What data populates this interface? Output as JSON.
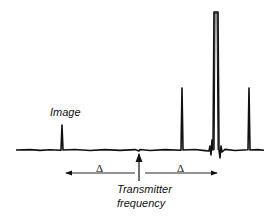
{
  "diagram": {
    "type": "nmr-spectrum",
    "labels": {
      "image": "Image",
      "transmitter_line1": "Transmitter",
      "transmitter_line2": "frequency",
      "delta_left": "Δ",
      "delta_right": "Δ"
    },
    "colors": {
      "trace": "#111111",
      "background": "#ffffff"
    },
    "peaks": [
      {
        "name": "image-peak",
        "x": 62,
        "height": 25
      },
      {
        "name": "peak-1",
        "x": 182,
        "height": 62
      },
      {
        "name": "main-peak",
        "x": 216,
        "height": 138
      },
      {
        "name": "peak-3",
        "x": 249,
        "height": 62
      }
    ]
  }
}
